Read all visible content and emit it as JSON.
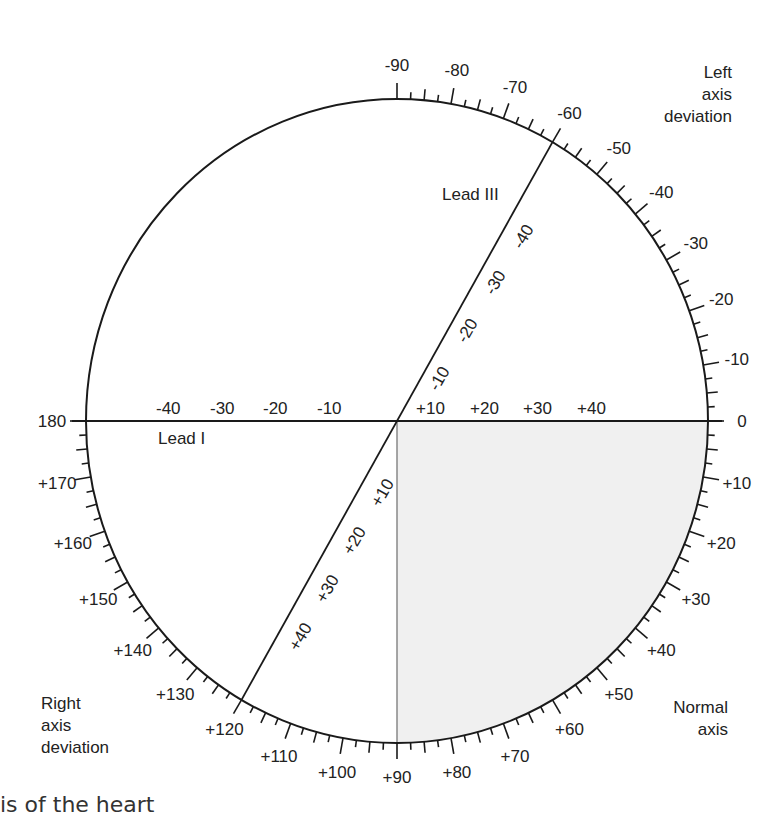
{
  "diagram": {
    "colors": {
      "stroke": "#1a1a1a",
      "shade": "#f0f0f0",
      "divider": "#888888",
      "text": "#222222"
    },
    "circle": {
      "cx": 397,
      "cy": 421,
      "rx": 311,
      "ry": 322
    },
    "scale": {
      "ticked_range_deg": [
        -90,
        180
      ],
      "major_every": 10,
      "mid_every": 5,
      "minor_every": 2.5,
      "labels": [
        {
          "deg": -90,
          "text": "-90"
        },
        {
          "deg": -80,
          "text": "-80"
        },
        {
          "deg": -70,
          "text": "-70"
        },
        {
          "deg": -60,
          "text": "-60"
        },
        {
          "deg": -50,
          "text": "-50"
        },
        {
          "deg": -40,
          "text": "-40"
        },
        {
          "deg": -30,
          "text": "-30"
        },
        {
          "deg": -20,
          "text": "-20"
        },
        {
          "deg": -10,
          "text": "-10"
        },
        {
          "deg": 0,
          "text": "0"
        },
        {
          "deg": 10,
          "text": "+10"
        },
        {
          "deg": 20,
          "text": "+20"
        },
        {
          "deg": 30,
          "text": "+30"
        },
        {
          "deg": 40,
          "text": "+40"
        },
        {
          "deg": 50,
          "text": "+50"
        },
        {
          "deg": 60,
          "text": "+60"
        },
        {
          "deg": 70,
          "text": "+70"
        },
        {
          "deg": 80,
          "text": "+80"
        },
        {
          "deg": 90,
          "text": "+90"
        },
        {
          "deg": 100,
          "text": "+100"
        },
        {
          "deg": 110,
          "text": "+110"
        },
        {
          "deg": 120,
          "text": "+120"
        },
        {
          "deg": 130,
          "text": "+130"
        },
        {
          "deg": 140,
          "text": "+140"
        },
        {
          "deg": 150,
          "text": "+150"
        },
        {
          "deg": 160,
          "text": "+160"
        },
        {
          "deg": 170,
          "text": "+170"
        },
        {
          "deg": 180,
          "text": "180"
        }
      ]
    },
    "leads": {
      "lead_i": {
        "name": "Lead I",
        "negative_labels": [
          "-40",
          "-30",
          "-20",
          "-10"
        ],
        "positive_labels": [
          "+10",
          "+20",
          "+30",
          "+40"
        ]
      },
      "lead_iii": {
        "name": "Lead III",
        "negative_labels": [
          "-10",
          "-20",
          "-30",
          "-40"
        ],
        "positive_labels": [
          "+10",
          "+20",
          "+30",
          "+40"
        ]
      }
    },
    "regions": {
      "left": [
        "Left",
        "axis",
        "deviation"
      ],
      "right": [
        "Right",
        "axis",
        "deviation"
      ],
      "normal": [
        "Normal",
        "axis"
      ]
    },
    "caption": "is of the heart"
  }
}
